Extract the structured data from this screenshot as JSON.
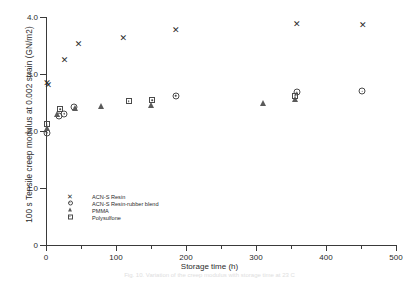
{
  "chart_data": {
    "type": "scatter",
    "title": "",
    "xlabel": "Storage time (h)",
    "ylabel": "100 s Tensile creep modulus at 0.002 strain (GN/m2)",
    "xlim": [
      0,
      500
    ],
    "ylim": [
      0,
      4.0
    ],
    "xticks": [
      0,
      100,
      200,
      300,
      400,
      500
    ],
    "xticks_minor": [
      50,
      150,
      250,
      350,
      450
    ],
    "yticks": [
      0,
      1.0,
      2.0,
      3.0,
      4.0
    ],
    "ytick_labels": [
      "0",
      "1.0",
      "2.0",
      "3.0",
      "4.0"
    ],
    "grid": false,
    "legend_position": "lower-left-inside",
    "series": [
      {
        "name": "ACN-S Resin",
        "marker": "cross",
        "points": [
          {
            "x": 1,
            "y": 2.85
          },
          {
            "x": 3,
            "y": 2.8
          },
          {
            "x": 26,
            "y": 3.25
          },
          {
            "x": 46,
            "y": 3.52
          },
          {
            "x": 110,
            "y": 3.64
          },
          {
            "x": 185,
            "y": 3.78
          },
          {
            "x": 358,
            "y": 3.87
          },
          {
            "x": 452,
            "y": 3.86
          }
        ]
      },
      {
        "name": "ACN-S Resin-rubber blend",
        "marker": "circle-dot",
        "points": [
          {
            "x": 1,
            "y": 1.97
          },
          {
            "x": 18,
            "y": 2.26
          },
          {
            "x": 26,
            "y": 2.3
          },
          {
            "x": 40,
            "y": 2.42
          },
          {
            "x": 185,
            "y": 2.62
          },
          {
            "x": 358,
            "y": 2.68
          },
          {
            "x": 452,
            "y": 2.7
          }
        ]
      },
      {
        "name": "PMMA",
        "marker": "triangle",
        "points": [
          {
            "x": 1,
            "y": 2.06
          },
          {
            "x": 16,
            "y": 2.3
          },
          {
            "x": 42,
            "y": 2.4
          },
          {
            "x": 78,
            "y": 2.44
          },
          {
            "x": 150,
            "y": 2.45
          },
          {
            "x": 310,
            "y": 2.5
          },
          {
            "x": 356,
            "y": 2.56
          }
        ]
      },
      {
        "name": "Polysulfone",
        "marker": "square-dot",
        "points": [
          {
            "x": 1,
            "y": 2.12
          },
          {
            "x": 20,
            "y": 2.38
          },
          {
            "x": 118,
            "y": 2.52
          },
          {
            "x": 152,
            "y": 2.54
          },
          {
            "x": 356,
            "y": 2.62
          }
        ]
      }
    ]
  },
  "legend": {
    "items": [
      {
        "marker": "cross-icon",
        "label": "ACN-S Resin"
      },
      {
        "marker": "circle-dot-icon",
        "label": "ACN-S Resin-rubber blend"
      },
      {
        "marker": "triangle-icon",
        "label": "PMMA"
      },
      {
        "marker": "square-dot-icon",
        "label": "Polysulfone"
      }
    ]
  },
  "caption": "Fig. 10.  Variation of the creep modulus with storage time at 23 C"
}
